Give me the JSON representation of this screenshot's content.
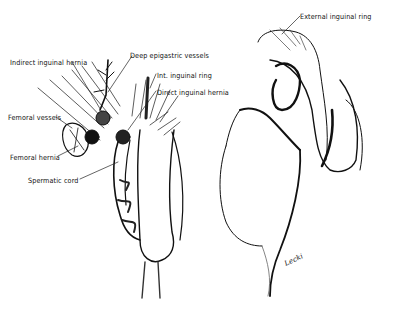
{
  "figure": {
    "left_illustration": {
      "labels": [
        {
          "id": "indirect",
          "text": "Indirect inguinal hernia",
          "x": 10,
          "y": 58
        },
        {
          "id": "deep-epigastric",
          "text": "Deep epigastric vessels",
          "x": 130,
          "y": 51
        },
        {
          "id": "int-ring",
          "text": "Int. inguinal ring",
          "x": 157,
          "y": 71
        },
        {
          "id": "direct",
          "text": "Direct inguinal hernia",
          "x": 157,
          "y": 88
        },
        {
          "id": "femoral-vessels",
          "text": "Femoral vessels",
          "x": 8,
          "y": 113
        },
        {
          "id": "femoral-hernia",
          "text": "Femoral hernia",
          "x": 10,
          "y": 153
        },
        {
          "id": "spermatic-cord",
          "text": "Spermatic cord",
          "x": 28,
          "y": 176
        }
      ]
    },
    "right_illustration": {
      "labels": [
        {
          "id": "external-ring",
          "text": "External inguinal ring",
          "x": 300,
          "y": 12
        }
      ],
      "signature": "Lecki"
    },
    "colors": {
      "ink": "#111111",
      "background": "#ffffff",
      "shade": "#555555"
    }
  }
}
